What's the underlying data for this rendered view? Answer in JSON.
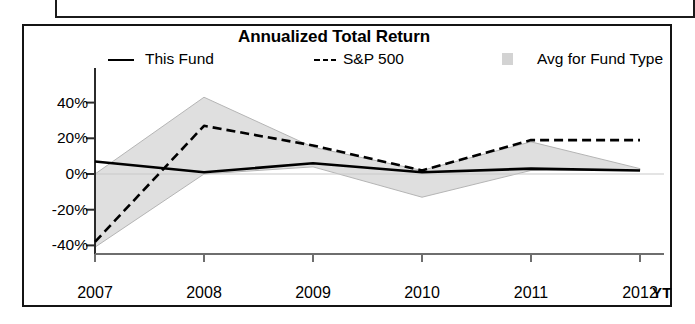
{
  "chart_title": "Annualized Total Return",
  "legend": {
    "items": [
      {
        "label": "This Fund",
        "marker": "solid-line-swatch",
        "color": "#000000"
      },
      {
        "label": "S&P 500",
        "marker": "dashed-line-swatch",
        "color": "#000000"
      },
      {
        "label": "Avg for Fund Type",
        "marker": "shaded-band-swatch",
        "color": "#d3d3d3"
      }
    ]
  },
  "axis": {
    "x_unit_label": "YT",
    "y_tick_labels": [
      "40%",
      "20%",
      "0%",
      "-20%",
      "-40%"
    ],
    "x_tick_labels": [
      "2007",
      "2008",
      "2009",
      "2010",
      "2011",
      "2012"
    ]
  },
  "chart_data": {
    "type": "line",
    "title": "Annualized Total Return",
    "xlabel": "",
    "ylabel": "",
    "x": [
      "2007",
      "2008",
      "2009",
      "2010",
      "2011",
      "2012"
    ],
    "categories": [
      "2007",
      "2008",
      "2009",
      "2010",
      "2011",
      "2012"
    ],
    "ylim": [
      -48,
      48
    ],
    "yticks": [
      -40,
      -20,
      0,
      20,
      40
    ],
    "ytick_labels": [
      "-40%",
      "-20%",
      "0%",
      "20%",
      "40%"
    ],
    "grid": false,
    "zero_line": true,
    "legend_position": "top",
    "series": [
      {
        "name": "This Fund",
        "style": "solid",
        "color": "#000000",
        "values": [
          7,
          1,
          6,
          1,
          3,
          2
        ]
      },
      {
        "name": "S&P 500",
        "style": "dashed",
        "color": "#000000",
        "values": [
          -38,
          27,
          16,
          2,
          19,
          19
        ]
      },
      {
        "name": "Avg for Fund Type",
        "style": "band",
        "color": "#d3d3d3",
        "band_upper": [
          0,
          43,
          15,
          2,
          18,
          3
        ],
        "band_lower": [
          -41,
          0,
          4,
          -13,
          2,
          2
        ]
      }
    ]
  }
}
